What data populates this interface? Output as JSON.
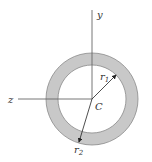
{
  "diagram": {
    "type": "hollow circular cross-section",
    "labels": {
      "y_axis": "y",
      "z_axis": "z",
      "centroid": "C",
      "inner_radius": "r",
      "inner_radius_sub": "1",
      "outer_radius": "r",
      "outer_radius_sub": "2"
    },
    "colors": {
      "ring_fill": "#c8c8c8",
      "ring_stroke": "#8a8a8a",
      "axis": "#666666",
      "background": "#ffffff"
    }
  }
}
